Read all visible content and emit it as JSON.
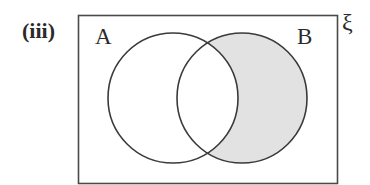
{
  "diagram": {
    "part_label": "(iii)",
    "type": "venn",
    "universal_set_symbol": "ξ",
    "sets": [
      {
        "name": "A",
        "label": "A",
        "cx": 173,
        "cy": 98,
        "r": 65
      },
      {
        "name": "B",
        "label": "B",
        "cx": 242,
        "cy": 98,
        "r": 65
      }
    ],
    "universe_rect": {
      "x": 78,
      "y": 15,
      "width": 259,
      "height": 168
    },
    "shaded_region": "B ∩ A'",
    "colors": {
      "stroke": "#3a3a3a",
      "shade": "#e2e2e2",
      "background": "#ffffff"
    }
  }
}
